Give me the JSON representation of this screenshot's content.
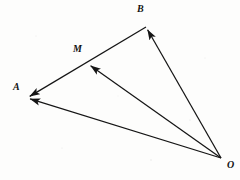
{
  "figure": {
    "kind": "vector-diagram",
    "background_color": "#fdfdfc",
    "stroke_color": "#151515",
    "label_color": "#121212",
    "width": 240,
    "height": 180,
    "points": [
      {
        "name": "O",
        "label": "O",
        "x": 221,
        "y": 158,
        "label_x": 227,
        "label_y": 160
      },
      {
        "name": "A",
        "label": "A",
        "x": 27,
        "y": 98,
        "label_x": 13,
        "label_y": 82
      },
      {
        "name": "B",
        "label": "B",
        "x": 146,
        "y": 27,
        "label_x": 137,
        "label_y": 4
      },
      {
        "name": "M",
        "label": "M",
        "x": 88,
        "y": 64,
        "label_x": 73,
        "label_y": 44
      }
    ],
    "vectors": [
      {
        "name": "vector-OA",
        "from": "O",
        "to": "A",
        "arrow_at_end": true
      },
      {
        "name": "vector-OB",
        "from": "O",
        "to": "B",
        "arrow_at_end": true
      },
      {
        "name": "vector-OM",
        "from": "O",
        "to": "M",
        "arrow_at_end": true
      },
      {
        "name": "segment-BA",
        "from": "B",
        "to": "A",
        "arrow_at_end": true
      }
    ]
  },
  "chart_data": {
    "type": "scatter",
    "title": "",
    "xlabel": "",
    "ylabel": "",
    "annotations": [
      "O",
      "A",
      "B",
      "M"
    ],
    "x": [
      221,
      27,
      146,
      88
    ],
    "y": [
      158,
      98,
      27,
      64
    ],
    "series": [
      {
        "name": "points",
        "values": [
          158,
          98,
          27,
          64
        ]
      }
    ],
    "edges": [
      [
        "O",
        "A"
      ],
      [
        "O",
        "B"
      ],
      [
        "O",
        "M"
      ],
      [
        "B",
        "A"
      ]
    ],
    "grid": false,
    "legend": "none",
    "xlim": [
      0,
      240
    ],
    "ylim": [
      0,
      180
    ]
  }
}
